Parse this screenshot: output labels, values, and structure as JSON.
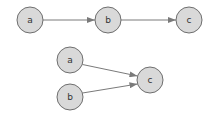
{
  "diagram": {
    "top_chain": {
      "nodes": [
        {
          "id": "a",
          "label": "a",
          "cx": 30,
          "cy": 20
        },
        {
          "id": "b",
          "label": "b",
          "cx": 108,
          "cy": 20
        },
        {
          "id": "c",
          "label": "c",
          "cx": 189,
          "cy": 20
        }
      ],
      "edges": [
        {
          "from": "a",
          "to": "b"
        },
        {
          "from": "b",
          "to": "c"
        }
      ]
    },
    "merge": {
      "nodes": [
        {
          "id": "a",
          "label": "a",
          "cx": 70,
          "cy": 60
        },
        {
          "id": "b",
          "label": "b",
          "cx": 70,
          "cy": 97
        },
        {
          "id": "c",
          "label": "c",
          "cx": 150,
          "cy": 80
        }
      ],
      "edges": [
        {
          "from": "a",
          "to": "c"
        },
        {
          "from": "b",
          "to": "c"
        }
      ]
    },
    "node_radius": 13,
    "colors": {
      "node_fill": "#d9d9d9",
      "node_stroke": "#6e6e6e",
      "edge": "#7a7a7a"
    }
  }
}
